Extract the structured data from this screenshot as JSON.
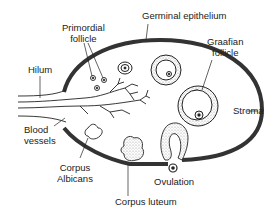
{
  "labels": {
    "primordial_follicle": [
      "Primordial",
      "follicle"
    ],
    "germinal_epithelium": "Germinal epithelium",
    "graafian_follicle": [
      "Graafian",
      "follicle"
    ],
    "hilum": "Hilum",
    "stroma": "Stroma",
    "blood_vessels": [
      "Blood",
      "vessels"
    ],
    "corpus_albicans": [
      "Corpus",
      "Albicans"
    ],
    "ovulation": "Ovulation",
    "corpus_luteum": "Corpus luteum"
  },
  "colors": {
    "outline": "#333333",
    "line": "#222222",
    "stipple": "#bbbbbb",
    "background": "#ffffff"
  }
}
